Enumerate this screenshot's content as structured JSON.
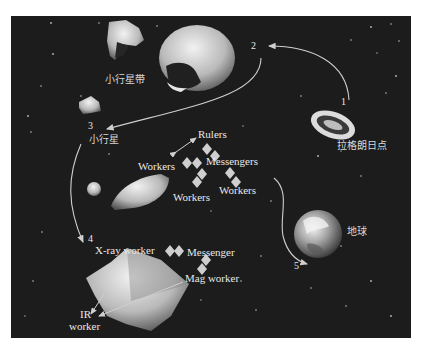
{
  "diagram": {
    "regions": {
      "asteroid_belt": "小行星带",
      "asteroid": "小行星",
      "lagrange_point": "拉格朗日点",
      "earth": "地球"
    },
    "steps": [
      "1",
      "2",
      "3",
      "4",
      "5"
    ],
    "swarm_labels": {
      "rulers": "Rulers",
      "messengers": "Messengers",
      "workers_left": "Workers",
      "workers_bottom": "Workers",
      "workers_right": "Workers"
    },
    "survey_labels": {
      "xray_worker": "X-ray worker",
      "messenger": "Messenger",
      "mag_worker": "Mag worker",
      "ir_worker_line1": "IR",
      "ir_worker_line2": "worker"
    },
    "colors": {
      "background": "#1c1c1c",
      "text": "#e8e8e8",
      "arrow": "#c8c8c8",
      "page": "#ffffff"
    }
  }
}
